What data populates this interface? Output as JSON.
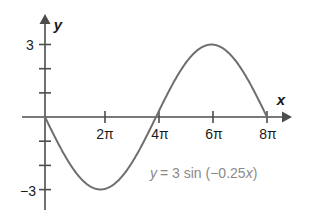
{
  "figure": {
    "background_color": "#ffffff",
    "axis_color": "#4d4d4d",
    "curve_color": "#6e6e6e",
    "equation_color": "#8a8a8a",
    "x_axis_label": "x",
    "y_axis_label": "y",
    "equation_parts": {
      "lhs": "y",
      "equals": "= 3 sin (−0.25",
      "var": "x",
      "close": ")"
    },
    "equation_full": "y = 3 sin (−0.25x)"
  },
  "chart_data": {
    "type": "line",
    "title": "",
    "xlabel": "x",
    "ylabel": "y",
    "equation": "y = 3 sin (-0.25x)",
    "amplitude": 3,
    "frequency_coefficient": -0.25,
    "period_in_pi": 8,
    "xlim_in_pi": [
      0,
      8
    ],
    "ylim": [
      -3.6,
      3.6
    ],
    "grid": false,
    "legend": "none",
    "x_ticks_in_pi": [
      2,
      4,
      6,
      8
    ],
    "x_tick_labels": [
      "2π",
      "4π",
      "6π",
      "8π"
    ],
    "y_ticks": [
      3,
      2,
      1,
      -1,
      -2,
      -3
    ],
    "y_tick_labels_shown": {
      "3": "3",
      "-3": "−3"
    },
    "key_points": [
      {
        "x_in_pi": 0,
        "y": 0,
        "note": "origin"
      },
      {
        "x_in_pi": 2,
        "y": -3,
        "note": "minimum"
      },
      {
        "x_in_pi": 4,
        "y": 0,
        "note": "zero crossing rising"
      },
      {
        "x_in_pi": 6,
        "y": 3,
        "note": "maximum"
      },
      {
        "x_in_pi": 8,
        "y": 0,
        "note": "zero crossing falling"
      }
    ],
    "series": [
      {
        "name": "y = 3 sin (-0.25x)",
        "x_in_pi": [
          0,
          0.5,
          1,
          1.5,
          2,
          2.5,
          3,
          3.5,
          4,
          4.5,
          5,
          5.5,
          6,
          6.5,
          7,
          7.5,
          8
        ],
        "values": [
          0,
          -1.15,
          -2.12,
          -2.77,
          -3,
          -2.77,
          -2.12,
          -1.15,
          0,
          1.15,
          2.12,
          2.77,
          3,
          2.77,
          2.12,
          1.15,
          0
        ]
      }
    ]
  },
  "tick_labels": {
    "y_top": "3",
    "y_bottom": "−3",
    "x1": "2π",
    "x2": "4π",
    "x3": "6π",
    "x4": "8π"
  }
}
